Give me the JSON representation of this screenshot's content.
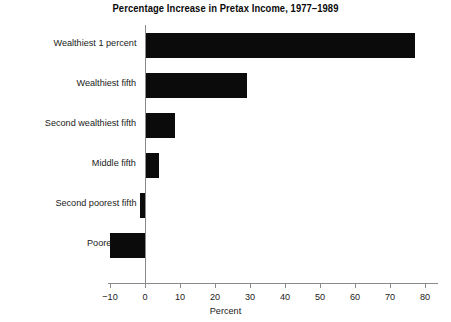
{
  "chart_data": {
    "type": "bar",
    "orientation": "horizontal",
    "title": "Percentage Increase in Pretax Income, 1977–1989",
    "xlabel": "Percent",
    "ylabel": "",
    "xlim": [
      -10,
      80
    ],
    "xticks": [
      -10,
      0,
      10,
      20,
      30,
      40,
      50,
      60,
      70,
      80
    ],
    "xtick_labels": [
      "−10",
      "0",
      "10",
      "20",
      "30",
      "40",
      "50",
      "60",
      "70",
      "80"
    ],
    "grid": false,
    "legend": false,
    "bar_color": "#0b0b0b",
    "axis_color": "#8a8a8a",
    "categories": [
      "Wealthiest 1 percent",
      "Wealthiest fifth",
      "Second wealthiest fifth",
      "Middle fifth",
      "Second poorest fifth",
      "Poorest fifth"
    ],
    "values": [
      77,
      29,
      8.5,
      4,
      -1.5,
      -10
    ]
  }
}
